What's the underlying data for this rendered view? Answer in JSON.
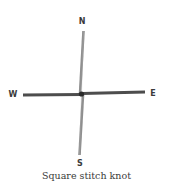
{
  "diagram": {
    "caption": "Square stitch knot",
    "labels": {
      "north": "N",
      "south": "S",
      "west": "W",
      "east": "E"
    },
    "colors": {
      "vertical_cord": "#8a8a8a",
      "horizontal_cord": "#4a4a4a",
      "knot": "#2a2a2a",
      "text": "#3a3a3a"
    }
  }
}
